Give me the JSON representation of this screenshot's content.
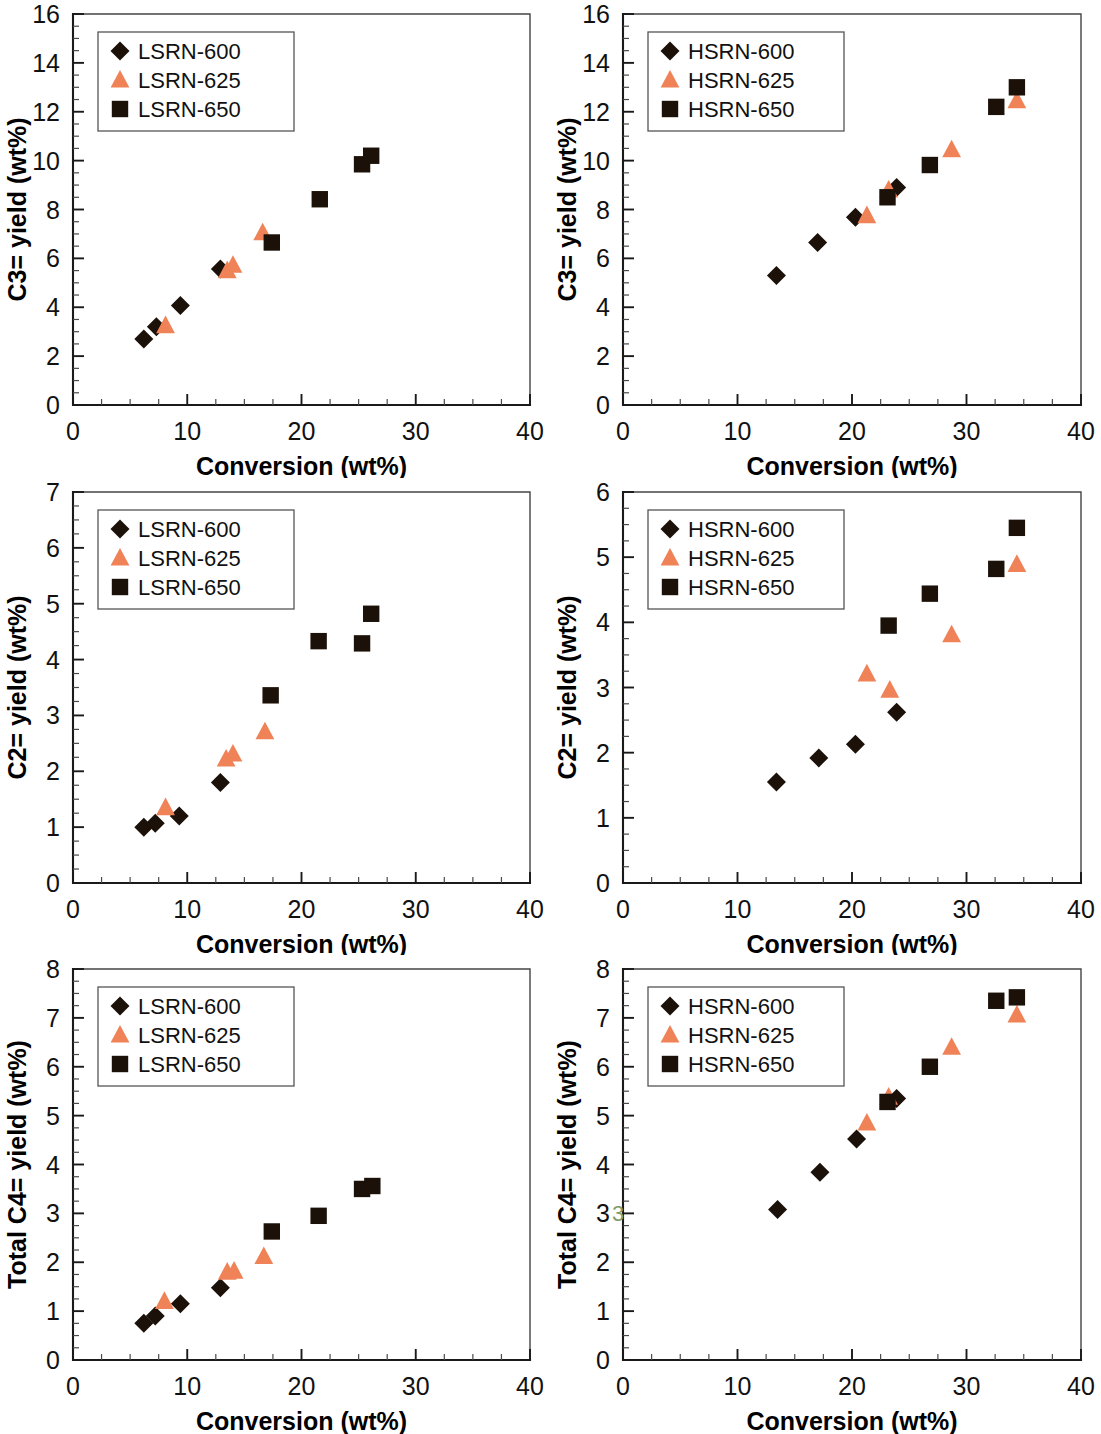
{
  "figure": {
    "layout": "2 columns x 3 rows of scatter panels",
    "marker_colors": {
      "series_600": "#1b1109",
      "series_625": "#f08257",
      "series_650": "#1b1109"
    },
    "common_xlabel": "Conversion (wt%)",
    "legend_marker_names": [
      "diamond-marker",
      "triangle-marker",
      "square-marker"
    ]
  },
  "chart_data": [
    {
      "id": "c3-lsrn",
      "type": "scatter",
      "title": "",
      "xlabel": "Conversion (wt%)",
      "ylabel": "C3= yield (wt%)",
      "xlim": [
        0,
        40
      ],
      "ylim": [
        0,
        16
      ],
      "xticks": [
        0,
        10,
        20,
        30,
        40
      ],
      "yticks": [
        0,
        2,
        4,
        6,
        8,
        10,
        12,
        14,
        16
      ],
      "x_minor_step": 2.5,
      "y_minor_step": 0.5,
      "grid": false,
      "legend_position": "top-left",
      "series": [
        {
          "name": "LSRN-600",
          "marker": "diamond",
          "color": "#1b1109",
          "points": [
            [
              6.2,
              2.7
            ],
            [
              7.3,
              3.2
            ],
            [
              9.4,
              4.07
            ],
            [
              12.9,
              5.57
            ]
          ]
        },
        {
          "name": "LSRN-625",
          "marker": "triangle",
          "color": "#f08257",
          "points": [
            [
              8.1,
              3.25
            ],
            [
              13.5,
              5.5
            ],
            [
              14.0,
              5.72
            ],
            [
              16.6,
              7.05
            ]
          ]
        },
        {
          "name": "LSRN-650",
          "marker": "square",
          "color": "#1b1109",
          "points": [
            [
              17.4,
              6.65
            ],
            [
              21.6,
              8.42
            ],
            [
              25.3,
              9.85
            ],
            [
              26.1,
              10.2
            ]
          ]
        }
      ]
    },
    {
      "id": "c3-hsrn",
      "type": "scatter",
      "title": "",
      "xlabel": "Conversion (wt%)",
      "ylabel": "C3= yield (wt%)",
      "xlim": [
        0,
        40
      ],
      "ylim": [
        0,
        16
      ],
      "xticks": [
        0,
        10,
        20,
        30,
        40
      ],
      "yticks": [
        0,
        2,
        4,
        6,
        8,
        10,
        12,
        14,
        16
      ],
      "x_minor_step": 2.5,
      "y_minor_step": 0.5,
      "grid": false,
      "legend_position": "top-left",
      "series": [
        {
          "name": "HSRN-600",
          "marker": "diamond",
          "color": "#1b1109",
          "points": [
            [
              13.4,
              5.3
            ],
            [
              17.0,
              6.65
            ],
            [
              20.3,
              7.68
            ],
            [
              23.9,
              8.9
            ]
          ]
        },
        {
          "name": "HSRN-625",
          "marker": "triangle",
          "color": "#f08257",
          "points": [
            [
              21.3,
              7.75
            ],
            [
              23.2,
              8.8
            ],
            [
              28.7,
              10.45
            ],
            [
              34.4,
              12.45
            ]
          ]
        },
        {
          "name": "HSRN-650",
          "marker": "square",
          "color": "#1b1109",
          "points": [
            [
              23.1,
              8.5
            ],
            [
              26.8,
              9.82
            ],
            [
              32.6,
              12.2
            ],
            [
              34.4,
              13.0
            ]
          ]
        }
      ]
    },
    {
      "id": "c2-lsrn",
      "type": "scatter",
      "title": "",
      "xlabel": "Conversion (wt%)",
      "ylabel": "C2= yield (wt%)",
      "xlim": [
        0,
        40
      ],
      "ylim": [
        0,
        7
      ],
      "xticks": [
        0,
        10,
        20,
        30,
        40
      ],
      "yticks": [
        0,
        1,
        2,
        3,
        4,
        5,
        6,
        7
      ],
      "x_minor_step": 2.5,
      "y_minor_step": 0.25,
      "grid": false,
      "legend_position": "top-left",
      "series": [
        {
          "name": "LSRN-600",
          "marker": "diamond",
          "color": "#1b1109",
          "points": [
            [
              6.2,
              1.0
            ],
            [
              7.2,
              1.07
            ],
            [
              9.3,
              1.2
            ],
            [
              12.9,
              1.8
            ]
          ]
        },
        {
          "name": "LSRN-625",
          "marker": "triangle",
          "color": "#f08257",
          "points": [
            [
              8.1,
              1.35
            ],
            [
              13.4,
              2.22
            ],
            [
              14.0,
              2.31
            ],
            [
              16.8,
              2.71
            ]
          ]
        },
        {
          "name": "LSRN-650",
          "marker": "square",
          "color": "#1b1109",
          "points": [
            [
              17.3,
              3.36
            ],
            [
              21.5,
              4.33
            ],
            [
              25.3,
              4.29
            ],
            [
              26.1,
              4.82
            ]
          ]
        }
      ]
    },
    {
      "id": "c2-hsrn",
      "type": "scatter",
      "title": "",
      "xlabel": "Conversion (wt%)",
      "ylabel": "C2= yield (wt%)",
      "xlim": [
        0,
        40
      ],
      "ylim": [
        0,
        6
      ],
      "xticks": [
        0,
        10,
        20,
        30,
        40
      ],
      "yticks": [
        0,
        1,
        2,
        3,
        4,
        5,
        6
      ],
      "x_minor_step": 2.5,
      "y_minor_step": 0.25,
      "grid": false,
      "legend_position": "top-left",
      "series": [
        {
          "name": "HSRN-600",
          "marker": "diamond",
          "color": "#1b1109",
          "points": [
            [
              13.4,
              1.55
            ],
            [
              17.1,
              1.92
            ],
            [
              20.3,
              2.13
            ],
            [
              23.9,
              2.62
            ]
          ]
        },
        {
          "name": "HSRN-625",
          "marker": "triangle",
          "color": "#f08257",
          "points": [
            [
              21.3,
              3.21
            ],
            [
              23.3,
              2.96
            ],
            [
              28.7,
              3.81
            ],
            [
              34.4,
              4.89
            ]
          ]
        },
        {
          "name": "HSRN-650",
          "marker": "square",
          "color": "#1b1109",
          "points": [
            [
              23.2,
              3.95
            ],
            [
              26.8,
              4.44
            ],
            [
              32.6,
              4.82
            ],
            [
              34.4,
              5.45
            ]
          ]
        }
      ]
    },
    {
      "id": "c4-lsrn",
      "type": "scatter",
      "title": "",
      "xlabel": "Conversion (wt%)",
      "ylabel": "Total C4= yield (wt%)",
      "xlim": [
        0,
        40
      ],
      "ylim": [
        0,
        8
      ],
      "xticks": [
        0,
        10,
        20,
        30,
        40
      ],
      "yticks": [
        0,
        1,
        2,
        3,
        4,
        5,
        6,
        7,
        8
      ],
      "x_minor_step": 2.5,
      "y_minor_step": 0.25,
      "grid": false,
      "legend_position": "top-left",
      "series": [
        {
          "name": "LSRN-600",
          "marker": "diamond",
          "color": "#1b1109",
          "points": [
            [
              6.2,
              0.75
            ],
            [
              7.2,
              0.9
            ],
            [
              9.4,
              1.15
            ],
            [
              12.9,
              1.48
            ]
          ]
        },
        {
          "name": "LSRN-625",
          "marker": "triangle",
          "color": "#f08257",
          "points": [
            [
              8.0,
              1.2
            ],
            [
              13.5,
              1.8
            ],
            [
              14.1,
              1.82
            ],
            [
              16.7,
              2.12
            ]
          ]
        },
        {
          "name": "LSRN-650",
          "marker": "square",
          "color": "#1b1109",
          "points": [
            [
              17.4,
              2.63
            ],
            [
              21.5,
              2.95
            ],
            [
              25.3,
              3.5
            ],
            [
              26.2,
              3.56
            ]
          ]
        }
      ]
    },
    {
      "id": "c4-hsrn",
      "type": "scatter",
      "title": "",
      "xlabel": "Conversion (wt%)",
      "ylabel": "Total C4= yield (wt%)",
      "xlim": [
        0,
        40
      ],
      "ylim": [
        0,
        8
      ],
      "xticks": [
        0,
        10,
        20,
        30,
        40
      ],
      "yticks": [
        0,
        1,
        2,
        3,
        4,
        5,
        6,
        7,
        8
      ],
      "x_minor_step": 2.5,
      "y_minor_step": 0.25,
      "grid": false,
      "legend_position": "top-left",
      "artifact_label": "3",
      "series": [
        {
          "name": "HSRN-600",
          "marker": "diamond",
          "color": "#1b1109",
          "points": [
            [
              13.5,
              3.08
            ],
            [
              17.2,
              3.84
            ],
            [
              20.4,
              4.52
            ],
            [
              23.9,
              5.35
            ]
          ]
        },
        {
          "name": "HSRN-625",
          "marker": "triangle",
          "color": "#f08257",
          "points": [
            [
              21.3,
              4.85
            ],
            [
              23.2,
              5.38
            ],
            [
              28.7,
              6.4
            ],
            [
              34.4,
              7.06
            ]
          ]
        },
        {
          "name": "HSRN-650",
          "marker": "square",
          "color": "#1b1109",
          "points": [
            [
              23.1,
              5.28
            ],
            [
              26.8,
              6.0
            ],
            [
              32.6,
              7.35
            ],
            [
              34.4,
              7.42
            ]
          ]
        }
      ]
    }
  ]
}
